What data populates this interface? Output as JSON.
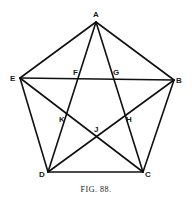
{
  "figure": {
    "caption": "FIG. 88.",
    "vertices": {
      "A": {
        "label": "A",
        "x": 96,
        "y": 22
      },
      "B": {
        "label": "B",
        "x": 174,
        "y": 80
      },
      "C": {
        "label": "C",
        "x": 143,
        "y": 172
      },
      "D": {
        "label": "D",
        "x": 48,
        "y": 172
      },
      "E": {
        "label": "E",
        "x": 20,
        "y": 78
      }
    },
    "intersections": {
      "F": {
        "label": "F"
      },
      "G": {
        "label": "G"
      },
      "H": {
        "label": "H"
      },
      "J": {
        "label": "J"
      },
      "K": {
        "label": "K"
      }
    },
    "pentagon_sides": [
      "AB",
      "BC",
      "CD",
      "DE",
      "EA"
    ],
    "diagonals": [
      "AC",
      "AD",
      "BD",
      "BE",
      "CE"
    ]
  }
}
